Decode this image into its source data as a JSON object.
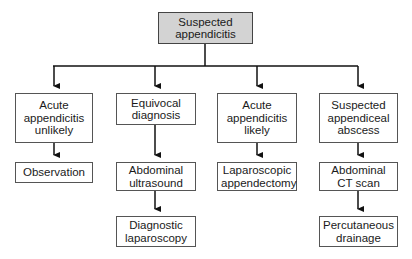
{
  "diagram": {
    "type": "flowchart",
    "root": {
      "label": "Suspected\nappendicitis",
      "fill": "#d3d3d3"
    },
    "branches": [
      {
        "label": "Acute\nappendicitis\nunlikely",
        "children": [
          {
            "label": "Observation"
          }
        ]
      },
      {
        "label": "Equivocal\ndiagnosis",
        "children": [
          {
            "label": "Abdominal\nultrasound"
          },
          {
            "label": "Diagnostic\nlaparoscopy"
          }
        ]
      },
      {
        "label": "Acute\nappendicitis\nlikely",
        "children": [
          {
            "label": "Laparoscopic\nappendectomy"
          }
        ]
      },
      {
        "label": "Suspected\nappendiceal\nabscess",
        "children": [
          {
            "label": "Abdominal\nCT scan"
          },
          {
            "label": "Percutaneous\ndrainage"
          }
        ]
      }
    ]
  },
  "nodes": {
    "root": "Suspected appendicitis",
    "b1": "Acute appendicitis unlikely",
    "b1c1": "Observation",
    "b2": "Equivocal diagnosis",
    "b2c1": "Abdominal ultrasound",
    "b2c2": "Diagnostic laparoscopy",
    "b3": "Acute appendicitis likely",
    "b3c1": "Laparoscopic appendectomy",
    "b4": "Suspected appendiceal abscess",
    "b4c1": "Abdominal CT scan",
    "b4c2": "Percutaneous drainage"
  },
  "colors": {
    "root_fill": "#d3d3d3",
    "line": "#111111",
    "border": "#555555"
  }
}
